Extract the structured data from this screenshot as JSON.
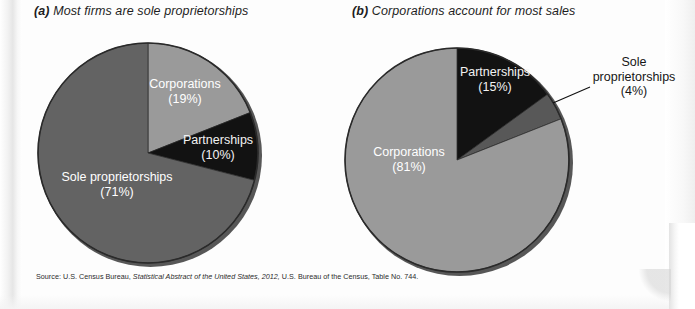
{
  "figure": {
    "source_prefix": "Source: U.S. Census Bureau,",
    "source_italic": "Statistical Abstract of the United States, 2012,",
    "source_suffix": "U.S. Bureau of the Census, Table No. 744."
  },
  "colors": {
    "light_gray": "#9a9a9a",
    "mid_gray": "#636363",
    "dark_gray": "#585858",
    "black": "#121212",
    "outline": "#2a2a2a",
    "background": "#fdfdfd",
    "label_light": "#ffffff",
    "label_dark": "#161616"
  },
  "panel_a": {
    "tag": "(a)",
    "title": "Most firms are sole proprietorships"
  },
  "panel_b": {
    "tag": "(b)",
    "title": "Corporations account for most sales"
  },
  "chart_data": [
    {
      "type": "pie",
      "id": "firms",
      "title": "(a) Most firms are sole proprietorships",
      "center": [
        148,
        153
      ],
      "radius": 110,
      "start_angle_deg": 0,
      "direction": "clockwise",
      "legend": "none",
      "units": "percent of firms",
      "slices": [
        {
          "name": "Corporations",
          "value": 19,
          "label": "Corporations",
          "value_label": "(19%)",
          "color": "#9a9a9a",
          "label_placement": "inside",
          "label_xy": [
            185,
            88
          ]
        },
        {
          "name": "Partnerships",
          "value": 10,
          "label": "Partnerships",
          "value_label": "(10%)",
          "color": "#121212",
          "label_placement": "inside",
          "label_xy": [
            218,
            144
          ]
        },
        {
          "name": "Sole proprietorships",
          "value": 71,
          "label": "Sole proprietorships",
          "value_label": "(71%)",
          "color": "#636363",
          "label_placement": "inside",
          "label_xy": [
            117,
            181
          ]
        }
      ]
    },
    {
      "type": "pie",
      "id": "sales",
      "title": "(b) Corporations account for most sales",
      "center": [
        457,
        160
      ],
      "radius": 112,
      "start_angle_deg": 0,
      "direction": "clockwise",
      "legend": "none",
      "units": "percent of sales",
      "slices": [
        {
          "name": "Partnerships",
          "value": 15,
          "label": "Partnerships",
          "value_label": "(15%)",
          "color": "#121212",
          "label_placement": "inside",
          "label_xy": [
            495,
            76
          ]
        },
        {
          "name": "Sole proprietorships",
          "value": 4,
          "label": "Sole proprietorships",
          "value_label": "(4%)",
          "color": "#585858",
          "label_placement": "outside",
          "label_xy": [
            634,
            66
          ],
          "leader_from": [
            553,
            103
          ],
          "leader_to": [
            590,
            87
          ]
        },
        {
          "name": "Corporations",
          "value": 81,
          "label": "Corporations",
          "value_label": "(81%)",
          "color": "#9a9a9a",
          "label_placement": "inside",
          "label_xy": [
            409,
            156
          ]
        }
      ]
    }
  ]
}
